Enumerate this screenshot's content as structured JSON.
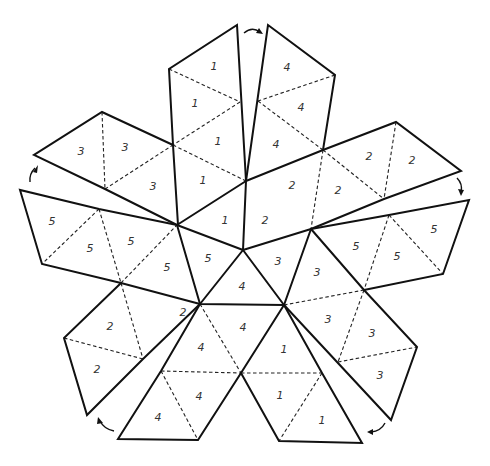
{
  "diagram": {
    "stroke_color": "#111111",
    "background": "#ffffff",
    "labels": [
      {
        "id": "t1a",
        "text": "1",
        "x": 214,
        "y": 67
      },
      {
        "id": "t1b",
        "text": "1",
        "x": 195,
        "y": 104
      },
      {
        "id": "t1c",
        "text": "1",
        "x": 218,
        "y": 142
      },
      {
        "id": "t1d",
        "text": "1",
        "x": 203,
        "y": 181
      },
      {
        "id": "t1e",
        "text": "1",
        "x": 225,
        "y": 221
      },
      {
        "id": "t4a",
        "text": "4",
        "x": 287,
        "y": 68
      },
      {
        "id": "t4b",
        "text": "4",
        "x": 301,
        "y": 108
      },
      {
        "id": "t4c",
        "text": "4",
        "x": 276,
        "y": 145
      },
      {
        "id": "t2a",
        "text": "2",
        "x": 292,
        "y": 186
      },
      {
        "id": "t2b",
        "text": "2",
        "x": 265,
        "y": 221
      },
      {
        "id": "t2c",
        "text": "2",
        "x": 338,
        "y": 191
      },
      {
        "id": "t2d",
        "text": "2",
        "x": 369,
        "y": 157
      },
      {
        "id": "t2e",
        "text": "2",
        "x": 412,
        "y": 161
      },
      {
        "id": "t3a",
        "text": "3",
        "x": 81,
        "y": 152
      },
      {
        "id": "t3b",
        "text": "3",
        "x": 125,
        "y": 148
      },
      {
        "id": "t3c",
        "text": "3",
        "x": 153,
        "y": 187
      },
      {
        "id": "t5a",
        "text": "5",
        "x": 52,
        "y": 222
      },
      {
        "id": "t5b",
        "text": "5",
        "x": 90,
        "y": 249
      },
      {
        "id": "t5c",
        "text": "5",
        "x": 131,
        "y": 242
      },
      {
        "id": "t5d",
        "text": "5",
        "x": 167,
        "y": 268
      },
      {
        "id": "t5e",
        "text": "5",
        "x": 208,
        "y": 259
      },
      {
        "id": "t4d",
        "text": "4",
        "x": 242,
        "y": 287
      },
      {
        "id": "t3d",
        "text": "3",
        "x": 278,
        "y": 262
      },
      {
        "id": "t3e",
        "text": "3",
        "x": 317,
        "y": 273
      },
      {
        "id": "t5f",
        "text": "5",
        "x": 356,
        "y": 247
      },
      {
        "id": "t5g",
        "text": "5",
        "x": 397,
        "y": 257
      },
      {
        "id": "t5h",
        "text": "5",
        "x": 434,
        "y": 230
      },
      {
        "id": "t2f",
        "text": "2",
        "x": 183,
        "y": 313
      },
      {
        "id": "t2g",
        "text": "2",
        "x": 110,
        "y": 327
      },
      {
        "id": "t2h",
        "text": "2",
        "x": 97,
        "y": 370
      },
      {
        "id": "t4e",
        "text": "4",
        "x": 243,
        "y": 328
      },
      {
        "id": "t4f",
        "text": "4",
        "x": 201,
        "y": 348
      },
      {
        "id": "t4g",
        "text": "4",
        "x": 199,
        "y": 397
      },
      {
        "id": "t4h",
        "text": "4",
        "x": 158,
        "y": 418
      },
      {
        "id": "t3f",
        "text": "3",
        "x": 328,
        "y": 320
      },
      {
        "id": "t3g",
        "text": "3",
        "x": 372,
        "y": 334
      },
      {
        "id": "t3h",
        "text": "3",
        "x": 380,
        "y": 376
      },
      {
        "id": "t1f",
        "text": "1",
        "x": 284,
        "y": 350
      },
      {
        "id": "t1g",
        "text": "1",
        "x": 280,
        "y": 396
      },
      {
        "id": "t1h",
        "text": "1",
        "x": 322,
        "y": 421
      }
    ],
    "arrows": [
      {
        "id": "arrow-top",
        "direction": "left-to-right"
      },
      {
        "id": "arrow-right",
        "direction": "downward"
      },
      {
        "id": "arrow-bottom-right",
        "direction": "leftward"
      },
      {
        "id": "arrow-bottom-left",
        "direction": "upward-left"
      },
      {
        "id": "arrow-left",
        "direction": "upward"
      }
    ]
  }
}
